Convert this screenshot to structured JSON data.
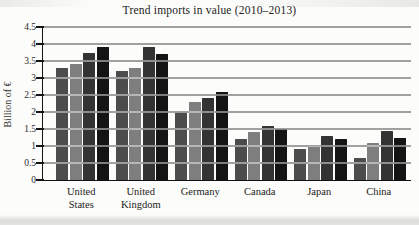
{
  "chart_data": {
    "type": "bar",
    "title": "Trend imports in value (2010–2013)",
    "ylabel": "Billion of €",
    "xlabel": "",
    "categories": [
      "United States",
      "United Kingdom",
      "Germany",
      "Canada",
      "Japan",
      "China"
    ],
    "category_label_lines": [
      [
        "United",
        "States"
      ],
      [
        "United",
        "Kingdom"
      ],
      [
        "Germany"
      ],
      [
        "Canada"
      ],
      [
        "Japan"
      ],
      [
        "China"
      ]
    ],
    "series": [
      {
        "name": "2010",
        "values": [
          3.3,
          3.2,
          2.0,
          1.2,
          0.9,
          0.65
        ]
      },
      {
        "name": "2011",
        "values": [
          3.4,
          3.3,
          2.3,
          1.4,
          1.0,
          1.1
        ]
      },
      {
        "name": "2012",
        "values": [
          3.75,
          3.9,
          2.4,
          1.6,
          1.3,
          1.45
        ]
      },
      {
        "name": "2013",
        "values": [
          3.9,
          3.7,
          2.6,
          1.5,
          1.2,
          1.25
        ]
      }
    ],
    "ylim": [
      0,
      4.5
    ],
    "yticks": [
      0,
      0.5,
      1,
      1.5,
      2,
      2.5,
      3,
      3.5,
      4,
      4.5
    ],
    "grid": true,
    "legend_position": "none",
    "bar_colors": [
      "#4c4c4c",
      "#7e7e7e",
      "#333333",
      "#141414"
    ]
  }
}
